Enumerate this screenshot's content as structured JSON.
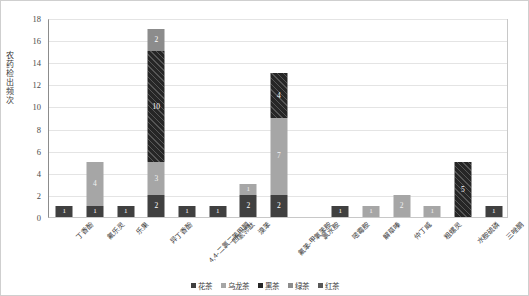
{
  "chart_data": {
    "type": "bar",
    "subtype": "stacked-column",
    "title": "",
    "xlabel": "",
    "ylabel": "农药检出频次",
    "ylim": [
      0,
      18
    ],
    "ytick_step": 2,
    "yticks": [
      0,
      2,
      4,
      6,
      8,
      10,
      12,
      14,
      16,
      18
    ],
    "grid": true,
    "grid_axis": "y",
    "legend_position": "bottom",
    "categories": [
      "丁香酚",
      "氟乐灵",
      "乐果",
      "异丁香酚",
      "4,4-二氯二苯甲酮",
      "四氢邻酞",
      "溴苯",
      "氟苯-甲氧苯胺",
      "氯水胺",
      "嘧霉胺",
      "解草嗪",
      "仲丁威",
      "粗螺灵",
      "水胺硫磷",
      "三唑酮"
    ],
    "series": [
      {
        "name": "花茶",
        "color": "#404040",
        "values": [
          1,
          1,
          1,
          2,
          1,
          1,
          2,
          2,
          0,
          1,
          0,
          0,
          0,
          0,
          1
        ]
      },
      {
        "name": "乌龙茶",
        "color": "#a6a6a6",
        "values": [
          0,
          4,
          0,
          3,
          0,
          0,
          1,
          7,
          0,
          0,
          1,
          2,
          1,
          0,
          0
        ]
      },
      {
        "name": "黑茶",
        "color": "#262626",
        "values": [
          0,
          0,
          0,
          10,
          0,
          0,
          0,
          4,
          0,
          0,
          0,
          0,
          0,
          5,
          0
        ]
      },
      {
        "name": "绿茶",
        "color": "#8c8c8c",
        "values": [
          0,
          0,
          0,
          2,
          0,
          0,
          0,
          0,
          0,
          0,
          0,
          0,
          0,
          0,
          0
        ]
      },
      {
        "name": "红茶",
        "color": "#595959",
        "values": [
          0,
          0,
          0,
          0,
          0,
          0,
          0,
          0,
          0,
          0,
          0,
          0,
          0,
          0,
          0
        ]
      }
    ],
    "totals": [
      1,
      5,
      1,
      17,
      1,
      1,
      3,
      13,
      0,
      1,
      1,
      2,
      1,
      5,
      1
    ],
    "data_labels": [
      [
        {
          "series": "花茶",
          "value": 1
        }
      ],
      [
        {
          "series": "花茶",
          "value": 1
        },
        {
          "series": "乌龙茶",
          "value": 4
        }
      ],
      [
        {
          "series": "花茶",
          "value": 1
        }
      ],
      [
        {
          "series": "花茶",
          "value": 2
        },
        {
          "series": "乌龙茶",
          "value": 3
        },
        {
          "series": "黑茶",
          "value": 10
        },
        {
          "series": "绿茶",
          "value": 2
        }
      ],
      [
        {
          "series": "花茶",
          "value": 1
        }
      ],
      [
        {
          "series": "花茶",
          "value": 1
        }
      ],
      [
        {
          "series": "花茶",
          "value": 2
        },
        {
          "series": "乌龙茶",
          "value": 1
        }
      ],
      [
        {
          "series": "花茶",
          "value": 2
        },
        {
          "series": "乌龙茶",
          "value": 7
        },
        {
          "series": "黑茶",
          "value": 4
        }
      ],
      [],
      [
        {
          "series": "花茶",
          "value": 1
        }
      ],
      [
        {
          "series": "乌龙茶",
          "value": 1
        }
      ],
      [
        {
          "series": "乌龙茶",
          "value": 2
        }
      ],
      [
        {
          "series": "乌龙茶",
          "value": 1
        }
      ],
      [
        {
          "series": "黑茶",
          "value": 5
        }
      ],
      [
        {
          "series": "花茶",
          "value": 1
        }
      ]
    ]
  }
}
